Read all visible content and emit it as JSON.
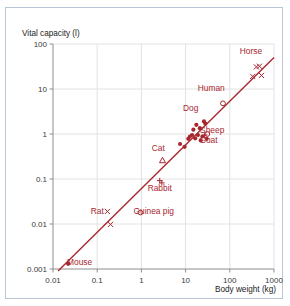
{
  "figure": {
    "frame_color": "#b9c4d4",
    "accent_color": "#a8272f",
    "grid_color": "#e2e2e2",
    "axis_color": "#8d8d8d"
  },
  "chart_data": {
    "type": "scatter",
    "title": "",
    "xlabel": "Body weight (kg)",
    "ylabel": "Vital capacity (l)",
    "xscale": "log",
    "yscale": "log",
    "xlim": [
      0.01,
      1000
    ],
    "ylim": [
      0.001,
      100
    ],
    "grid": true,
    "legend": "none",
    "xticks": [
      "0.01",
      "0.1",
      "1",
      "10",
      "100",
      "1000"
    ],
    "xtick_values": [
      0.01,
      0.1,
      1,
      10,
      100,
      1000
    ],
    "yticks": [
      "0.001",
      "0.01",
      "0.1",
      "1",
      "10",
      "100"
    ],
    "ytick_values": [
      0.001,
      0.01,
      0.1,
      1,
      10,
      100
    ],
    "trend_line": {
      "x": [
        0.013,
        1000
      ],
      "y": [
        0.0009,
        50
      ],
      "color": "#a8272f"
    },
    "annotations": [
      {
        "text": "Horse",
        "x": 300,
        "y": 60
      },
      {
        "text": "Human",
        "x": 38,
        "y": 9
      },
      {
        "text": "Dog",
        "x": 13,
        "y": 3.2
      },
      {
        "text": "Sheep",
        "x": 40,
        "y": 1.05
      },
      {
        "text": "Goat",
        "x": 33,
        "y": 0.62
      },
      {
        "text": "Cat",
        "x": 2.4,
        "y": 0.42
      },
      {
        "text": "Rabbit",
        "x": 2.6,
        "y": 0.055
      },
      {
        "text": "Guinea pig",
        "x": 1.9,
        "y": 0.017
      },
      {
        "text": "Rat",
        "x": 0.1,
        "y": 0.017
      },
      {
        "text": "Mouse",
        "x": 0.04,
        "y": 0.0012
      }
    ],
    "series": [
      {
        "name": "Mouse",
        "marker": "filled-circle",
        "points": [
          [
            0.022,
            0.0013
          ]
        ]
      },
      {
        "name": "Rat",
        "marker": "cross-x",
        "points": [
          [
            0.17,
            0.019
          ],
          [
            0.2,
            0.0098
          ]
        ]
      },
      {
        "name": "Guinea pig",
        "marker": "open-circle",
        "points": [
          [
            0.95,
            0.018
          ]
        ]
      },
      {
        "name": "Rabbit",
        "marker": "plus",
        "points": [
          [
            2.6,
            0.092
          ],
          [
            2.9,
            0.082
          ]
        ]
      },
      {
        "name": "Cat",
        "marker": "triangle",
        "points": [
          [
            3.0,
            0.26
          ]
        ]
      },
      {
        "name": "Mid-size mammals",
        "marker": "filled-circle",
        "points": [
          [
            7.5,
            0.6
          ],
          [
            9.5,
            0.52
          ],
          [
            11.5,
            0.78
          ],
          [
            12.5,
            0.88
          ],
          [
            14.0,
            0.95
          ],
          [
            15.0,
            1.25
          ],
          [
            16.5,
            0.8
          ],
          [
            17.5,
            1.6
          ],
          [
            19.0,
            0.95
          ],
          [
            21.0,
            1.35
          ],
          [
            22.0,
            0.72
          ],
          [
            24.0,
            0.88
          ],
          [
            26.0,
            1.9
          ],
          [
            28.0,
            1.7
          ],
          [
            30.0,
            0.78
          ]
        ]
      },
      {
        "name": "Sheep",
        "marker": "open-circle",
        "points": [
          [
            31.0,
            1.0
          ]
        ]
      },
      {
        "name": "Goat",
        "marker": "plus",
        "points": [
          [
            27.0,
            0.95
          ]
        ]
      },
      {
        "name": "Human",
        "marker": "open-circle",
        "points": [
          [
            70.0,
            4.8
          ]
        ]
      },
      {
        "name": "Horse",
        "marker": "cross-x",
        "points": [
          [
            330,
            19
          ],
          [
            520,
            20
          ],
          [
            400,
            31
          ],
          [
            470,
            32
          ]
        ]
      }
    ]
  }
}
